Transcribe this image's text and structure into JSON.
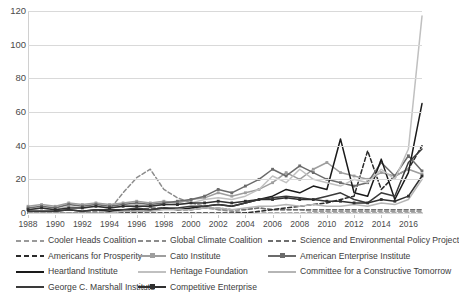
{
  "chart_data": {
    "type": "line",
    "title": "",
    "subtitle": "",
    "xlabel": "",
    "ylabel": "",
    "xlim": [
      1988,
      2017
    ],
    "ylim": [
      0,
      120
    ],
    "ytick_step": 20,
    "yticks": [
      0,
      20,
      40,
      60,
      80,
      100,
      120
    ],
    "xticks": [
      1988,
      1990,
      1992,
      1994,
      1996,
      1998,
      2000,
      2002,
      2004,
      2006,
      2008,
      2010,
      2012,
      2014,
      2016
    ],
    "x": [
      1988,
      1989,
      1990,
      1991,
      1992,
      1993,
      1994,
      1995,
      1996,
      1997,
      1998,
      1999,
      2000,
      2001,
      2002,
      2003,
      2004,
      2005,
      2006,
      2007,
      2008,
      2009,
      2010,
      2011,
      2012,
      2013,
      2014,
      2015,
      2016,
      2017
    ],
    "grid": "horizontal",
    "legend_position": "bottom",
    "legend_columns": 3,
    "series": [
      {
        "name": "Cooler Heads Coalition",
        "style": "dashed",
        "color": "#9a9a9a",
        "marker": "none",
        "values": [
          0,
          0,
          0,
          0,
          0,
          0,
          0,
          0,
          0,
          2,
          3,
          2,
          2,
          3,
          2,
          2,
          2,
          3,
          2,
          2,
          2,
          1,
          1,
          1,
          1,
          1,
          1,
          1,
          1,
          1
        ]
      },
      {
        "name": "Global Climate Coalition",
        "style": "dashed",
        "color": "#8c8c8c",
        "marker": "none",
        "values": [
          0,
          0,
          0,
          0,
          0,
          1,
          2,
          12,
          21,
          26,
          14,
          9,
          6,
          4,
          2,
          1,
          0,
          0,
          0,
          0,
          0,
          0,
          0,
          0,
          0,
          0,
          0,
          0,
          0,
          0
        ]
      },
      {
        "name": "Science and Environmental Policy Project",
        "style": "dashed",
        "color": "#6e6e6e",
        "marker": "none",
        "values": [
          0,
          0,
          0,
          0,
          0,
          0,
          0,
          1,
          2,
          3,
          3,
          2,
          2,
          3,
          3,
          2,
          2,
          3,
          2,
          2,
          2,
          2,
          2,
          2,
          2,
          2,
          2,
          2,
          2,
          2
        ]
      },
      {
        "name": "Americans for Prosperity",
        "style": "dashed",
        "color": "#2b2b2b",
        "marker": "none",
        "values": [
          0,
          0,
          0,
          0,
          0,
          0,
          0,
          0,
          0,
          0,
          0,
          0,
          0,
          0,
          0,
          0,
          0,
          1,
          2,
          3,
          4,
          5,
          6,
          8,
          10,
          37,
          14,
          22,
          26,
          40
        ]
      },
      {
        "name": "Cato Institute",
        "style": "solid-marker",
        "color": "#9e9e9e",
        "marker": "square",
        "values": [
          4,
          5,
          4,
          6,
          5,
          6,
          5,
          6,
          7,
          6,
          7,
          6,
          8,
          9,
          12,
          10,
          12,
          14,
          18,
          24,
          20,
          26,
          30,
          24,
          22,
          20,
          24,
          22,
          26,
          23
        ]
      },
      {
        "name": "American Enterprise Institute",
        "style": "solid-marker",
        "color": "#6b6b6b",
        "marker": "square",
        "values": [
          3,
          4,
          3,
          5,
          4,
          5,
          4,
          5,
          6,
          5,
          6,
          7,
          8,
          10,
          14,
          12,
          16,
          20,
          26,
          22,
          28,
          24,
          20,
          18,
          16,
          18,
          30,
          22,
          34,
          25
        ]
      },
      {
        "name": "Heartland Institute",
        "style": "solid",
        "color": "#1a1a1a",
        "marker": "none",
        "values": [
          1,
          1,
          1,
          2,
          1,
          2,
          1,
          2,
          2,
          2,
          3,
          2,
          3,
          4,
          5,
          4,
          6,
          8,
          10,
          14,
          12,
          16,
          14,
          44,
          12,
          10,
          32,
          8,
          24,
          65
        ]
      },
      {
        "name": "Heritage Foundation",
        "style": "solid",
        "color": "#c0c0c0",
        "marker": "none",
        "values": [
          2,
          3,
          2,
          4,
          3,
          4,
          3,
          4,
          5,
          4,
          5,
          5,
          6,
          8,
          9,
          8,
          10,
          14,
          22,
          18,
          26,
          20,
          18,
          16,
          20,
          18,
          26,
          20,
          38,
          117
        ]
      },
      {
        "name": "Committee for a Constructive Tomorrow",
        "style": "solid",
        "color": "#b5b5b5",
        "marker": "none",
        "values": [
          0,
          0,
          0,
          0,
          0,
          0,
          0,
          1,
          1,
          1,
          2,
          2,
          2,
          3,
          3,
          2,
          3,
          4,
          4,
          5,
          4,
          5,
          4,
          4,
          5,
          4,
          6,
          5,
          8,
          20
        ]
      },
      {
        "name": "George C. Marshall Institute",
        "style": "solid",
        "color": "#3a3a3a",
        "marker": "none",
        "values": [
          1,
          1,
          1,
          2,
          1,
          2,
          2,
          2,
          3,
          2,
          3,
          3,
          4,
          4,
          5,
          4,
          6,
          8,
          9,
          10,
          9,
          8,
          10,
          12,
          8,
          6,
          12,
          10,
          30,
          38
        ]
      },
      {
        "name": "Competitive Enterprise",
        "style": "solid-marker",
        "color": "#303030",
        "marker": "square",
        "values": [
          2,
          3,
          2,
          3,
          3,
          4,
          3,
          4,
          4,
          4,
          5,
          5,
          6,
          6,
          7,
          6,
          7,
          8,
          8,
          9,
          8,
          8,
          7,
          7,
          6,
          6,
          8,
          7,
          10,
          22
        ]
      }
    ]
  },
  "legend": {
    "rows": [
      [
        {
          "label": "Cooler Heads Coalition",
          "series_index": 0
        },
        {
          "label": "Global Climate Coalition",
          "series_index": 1
        },
        {
          "label": "Science and Environmental Policy Project",
          "series_index": 2
        }
      ],
      [
        {
          "label": "Americans for Prosperity",
          "series_index": 3
        },
        {
          "label": "Cato Institute",
          "series_index": 4
        },
        {
          "label": "American Enterprise Institute",
          "series_index": 5
        }
      ],
      [
        {
          "label": "Heartland Institute",
          "series_index": 6
        },
        {
          "label": "Heritage Foundation",
          "series_index": 7
        },
        {
          "label": "Committee for a Constructive Tomorrow",
          "series_index": 8
        }
      ],
      [
        {
          "label": "George C. Marshall Institute",
          "series_index": 9
        },
        {
          "label": "Competitive Enterprise",
          "series_index": 10
        }
      ]
    ]
  }
}
